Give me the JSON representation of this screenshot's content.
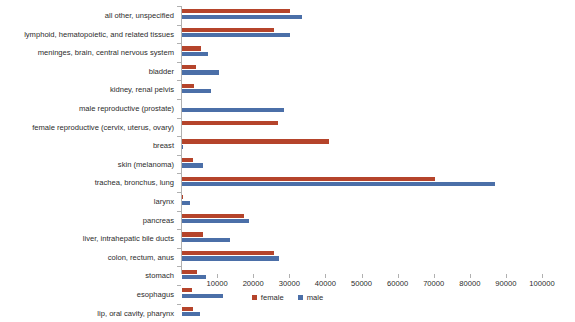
{
  "chart_data": {
    "type": "bar",
    "orientation": "horizontal",
    "title": "",
    "xlabel": "",
    "ylabel": "",
    "xlim": [
      0,
      100000
    ],
    "xticks": [
      10000,
      20000,
      30000,
      40000,
      50000,
      60000,
      70000,
      80000,
      90000,
      100000
    ],
    "xtick_labels": [
      "10000",
      "20000",
      "30000",
      "40000",
      "50000",
      "60000",
      "70000",
      "80000",
      "90000",
      "100000"
    ],
    "grid": false,
    "legend_position": "bottom-center",
    "categories": [
      "all other, unspecified",
      "lymphoid, hematopoietic, and related tissues",
      "meninges, brain, central nervous system",
      "bladder",
      "kidney, renal pelvis",
      "male reproductive (prostate)",
      "female reproductive (cervix, uterus, ovary)",
      "breast",
      "skin (melanoma)",
      "trachea, bronchus, lung",
      "larynx",
      "pancreas",
      "liver, intrahepatic bile ducts",
      "colon, rectum, anus",
      "stomach",
      "esophagus",
      "lip, oral cavity, pharynx"
    ],
    "series": [
      {
        "name": "female",
        "color": "#b5442b",
        "values": [
          30000,
          25500,
          5300,
          3900,
          3300,
          0,
          26500,
          40700,
          3000,
          70000,
          400,
          17200,
          5800,
          25500,
          4100,
          2800,
          3000
        ]
      },
      {
        "name": "male",
        "color": "#4b6fa8",
        "values": [
          33200,
          30000,
          7200,
          10200,
          8000,
          28200,
          0,
          400,
          5800,
          86700,
          2300,
          18500,
          13200,
          26900,
          6600,
          11300,
          4900
        ]
      }
    ],
    "legend": [
      {
        "label": "female",
        "color": "#b5442b"
      },
      {
        "label": "male",
        "color": "#4b6fa8"
      }
    ]
  }
}
